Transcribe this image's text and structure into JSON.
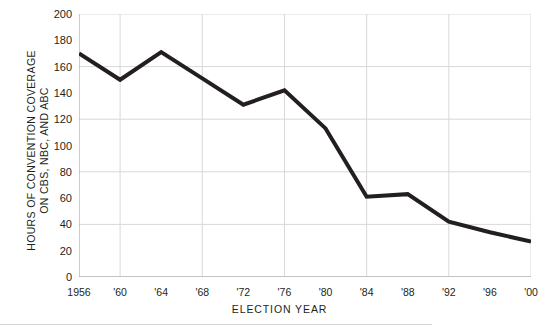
{
  "figure": {
    "ghost_text": "                                                                      ",
    "rule_visible": true
  },
  "chart_data": {
    "type": "line",
    "title": "",
    "xlabel": "ELECTION  YEAR",
    "ylabel": "HOURS OF CONVENTION COVERAGE\nON CBS, NBC, AND ABC",
    "categories": [
      "1956",
      "'60",
      "'64",
      "'68",
      "'72",
      "'76",
      "'80",
      "'84",
      "'88",
      "'92",
      "'96",
      "'00"
    ],
    "x_values": [
      1956,
      1960,
      1964,
      1968,
      1972,
      1976,
      1980,
      1984,
      1988,
      1992,
      1996,
      2000
    ],
    "values": [
      170,
      150,
      171,
      151,
      131,
      142,
      113,
      61,
      63,
      42,
      34,
      27
    ],
    "series": [
      {
        "name": "Hours of convention coverage on CBS, NBC, and ABC",
        "values": [
          170,
          150,
          171,
          151,
          131,
          142,
          113,
          61,
          63,
          42,
          34,
          27
        ],
        "color": "#231f20",
        "line_width": 4
      }
    ],
    "ylim": [
      0,
      200
    ],
    "xlim": [
      1956,
      2000
    ],
    "y_ticks": [
      0,
      20,
      40,
      60,
      80,
      100,
      120,
      140,
      160,
      180,
      200
    ],
    "y_tick_labels": [
      "0",
      "20",
      "40",
      "60",
      "80",
      "100",
      "120",
      "140",
      "160",
      "180",
      "200"
    ],
    "y_gridlines": [
      0,
      40,
      80,
      120,
      160,
      200
    ],
    "x_gridlines": [
      "'60",
      "'68",
      "'76",
      "'84",
      "'92",
      "'00"
    ],
    "grid": true,
    "grid_color": "#d8d8dc",
    "axis_color": "#9a9a9f",
    "legend": "none",
    "annotations": []
  }
}
